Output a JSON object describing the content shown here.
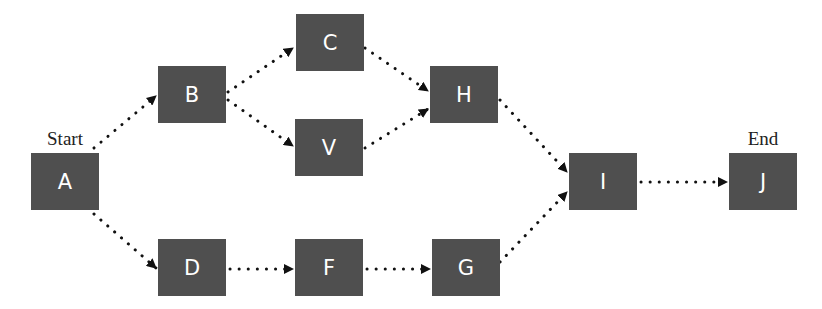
{
  "diagram": {
    "type": "activity-network",
    "colors": {
      "node_fill": "#4f4f4f",
      "node_text": "#ffffff",
      "edge": "#111111"
    },
    "labels": {
      "start": "Start",
      "end": "End"
    },
    "nodes": {
      "A": "A",
      "B": "B",
      "C": "C",
      "V": "V",
      "D": "D",
      "F": "F",
      "H": "H",
      "G": "G",
      "I": "I",
      "J": "J"
    },
    "edges": [
      [
        "A",
        "B"
      ],
      [
        "A",
        "D"
      ],
      [
        "B",
        "C"
      ],
      [
        "B",
        "V"
      ],
      [
        "C",
        "H"
      ],
      [
        "V",
        "H"
      ],
      [
        "D",
        "F"
      ],
      [
        "F",
        "G"
      ],
      [
        "H",
        "I"
      ],
      [
        "G",
        "I"
      ],
      [
        "I",
        "J"
      ]
    ]
  }
}
